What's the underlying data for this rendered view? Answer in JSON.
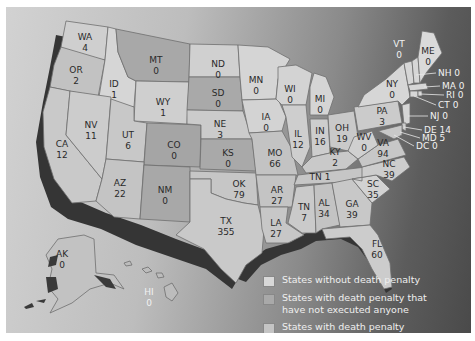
{
  "colors": {
    "no_death_penalty": "#d8d8d8",
    "death_penalty_no_executions": "#a9a9a9",
    "death_penalty": "#c4c4c4",
    "coast_shadow": "#3a3a3a"
  },
  "legend": {
    "items": [
      {
        "label": "States without death penalty",
        "color": "#d8d8d8"
      },
      {
        "label": "States with death penalty that have not executed anyone",
        "line1": "States with death penalty that",
        "line2": "have not executed anyone",
        "color": "#a9a9a9"
      },
      {
        "label": "States with death penalty",
        "color": "#c4c4c4"
      }
    ]
  },
  "states": [
    {
      "abbr": "WA",
      "value": "4"
    },
    {
      "abbr": "OR",
      "value": "2"
    },
    {
      "abbr": "CA",
      "value": "12"
    },
    {
      "abbr": "ID",
      "value": "1"
    },
    {
      "abbr": "NV",
      "value": "11"
    },
    {
      "abbr": "MT",
      "value": "0"
    },
    {
      "abbr": "WY",
      "value": "1"
    },
    {
      "abbr": "UT",
      "value": "6"
    },
    {
      "abbr": "AZ",
      "value": "22"
    },
    {
      "abbr": "CO",
      "value": "0"
    },
    {
      "abbr": "NM",
      "value": "0"
    },
    {
      "abbr": "ND",
      "value": "0"
    },
    {
      "abbr": "SD",
      "value": "0"
    },
    {
      "abbr": "NE",
      "value": "3"
    },
    {
      "abbr": "KS",
      "value": "0"
    },
    {
      "abbr": "OK",
      "value": "79"
    },
    {
      "abbr": "TX",
      "value": "355"
    },
    {
      "abbr": "MN",
      "value": "0"
    },
    {
      "abbr": "IA",
      "value": "0"
    },
    {
      "abbr": "MO",
      "value": "66"
    },
    {
      "abbr": "AR",
      "value": "27"
    },
    {
      "abbr": "LA",
      "value": "27"
    },
    {
      "abbr": "WI",
      "value": "0"
    },
    {
      "abbr": "IL",
      "value": "12"
    },
    {
      "abbr": "MI",
      "value": "0"
    },
    {
      "abbr": "IN",
      "value": "16"
    },
    {
      "abbr": "OH",
      "value": "19"
    },
    {
      "abbr": "KY",
      "value": "2"
    },
    {
      "abbr": "TN",
      "value": "1"
    },
    {
      "abbr": "MS",
      "value": "7"
    },
    {
      "abbr": "AL",
      "value": "34"
    },
    {
      "abbr": "GA",
      "value": "39"
    },
    {
      "abbr": "FL",
      "value": "60"
    },
    {
      "abbr": "SC",
      "value": "35"
    },
    {
      "abbr": "NC",
      "value": "39"
    },
    {
      "abbr": "VA",
      "value": "94"
    },
    {
      "abbr": "WV",
      "value": "0"
    },
    {
      "abbr": "PA",
      "value": "3"
    },
    {
      "abbr": "NY",
      "value": "0"
    },
    {
      "abbr": "VT",
      "value": "0"
    },
    {
      "abbr": "ME",
      "value": "0"
    },
    {
      "abbr": "NH",
      "value": "0"
    },
    {
      "abbr": "MA",
      "value": "0"
    },
    {
      "abbr": "RI",
      "value": "0"
    },
    {
      "abbr": "CT",
      "value": "0"
    },
    {
      "abbr": "NJ",
      "value": "0"
    },
    {
      "abbr": "DE",
      "value": "14"
    },
    {
      "abbr": "MD",
      "value": "5"
    },
    {
      "abbr": "DC",
      "value": "0"
    },
    {
      "abbr": "AK",
      "value": "0"
    },
    {
      "abbr": "HI",
      "value": "0"
    }
  ],
  "callouts": {
    "NH": "NH 0",
    "MA": "MA 0",
    "RI": "RI 0",
    "CT": "CT 0",
    "NJ": "NJ 0",
    "DE": "DE 14",
    "MD": "MD 5",
    "DC": "DC 0",
    "TN": "TN 1"
  }
}
